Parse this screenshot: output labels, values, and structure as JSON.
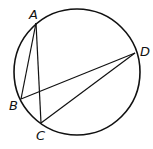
{
  "diagram": {
    "type": "inscribed-angles",
    "circle": {
      "cx": 77,
      "cy": 72,
      "r": 63
    },
    "points": [
      {
        "label": "A",
        "x": 36,
        "y": 23,
        "lx": 29,
        "ly": 19
      },
      {
        "label": "B",
        "x": 21,
        "y": 99,
        "lx": 9,
        "ly": 110
      },
      {
        "label": "C",
        "x": 41,
        "y": 123,
        "lx": 36,
        "ly": 139
      },
      {
        "label": "D",
        "x": 135,
        "y": 53,
        "lx": 140,
        "ly": 56
      }
    ],
    "segments": [
      [
        "A",
        "B"
      ],
      [
        "A",
        "C"
      ],
      [
        "B",
        "D"
      ],
      [
        "C",
        "D"
      ]
    ],
    "stroke_color": "#111111"
  }
}
